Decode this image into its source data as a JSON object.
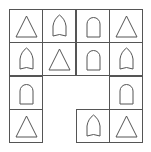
{
  "puzzle": {
    "rows": 4,
    "cols": 4,
    "cells": [
      [
        "triangle",
        "pointed-arch",
        "round-arch",
        "triangle"
      ],
      [
        "pointed-arch",
        "triangle",
        "round-arch",
        "pointed-arch"
      ],
      [
        "round-arch",
        null,
        null,
        "round-arch"
      ],
      [
        "triangle",
        null,
        "pointed-arch",
        "triangle"
      ]
    ]
  },
  "colors": {
    "stroke": "#555555",
    "background": "#ffffff"
  }
}
